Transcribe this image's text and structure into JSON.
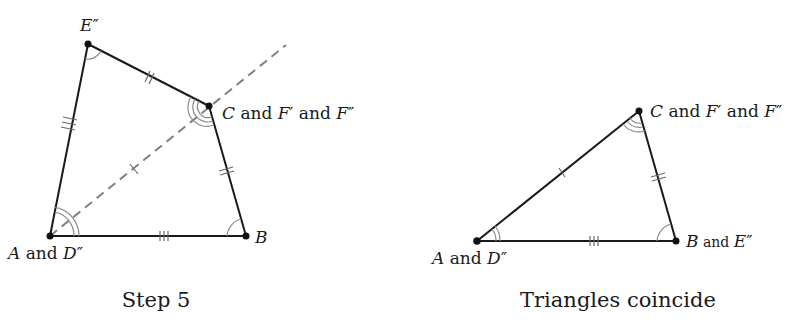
{
  "figures": [
    {
      "id": "step5",
      "caption": "Step 5",
      "vertices": {
        "E": {
          "x": 88,
          "y": 44,
          "label_main": "E",
          "label_rest": "″"
        },
        "C": {
          "x": 209,
          "y": 106,
          "label_main": "C",
          "label_rest": " and ",
          "label_f1": "F",
          "label_f1p": "′",
          "label_and2": " and ",
          "label_f2": "F",
          "label_f2p": "″"
        },
        "A": {
          "x": 50,
          "y": 236,
          "label_main": "A",
          "label_rest": " and ",
          "label_d": "D",
          "label_dp": "″"
        },
        "B": {
          "x": 246,
          "y": 236,
          "label_main": "B"
        }
      },
      "dashed_line": {
        "from": [
          50,
          236
        ],
        "to": [
          286,
          45
        ]
      },
      "tick_marks": {
        "A_E": 3,
        "E_C": 2,
        "C_B": 2,
        "A_B": 3,
        "A_C_dashed": 1
      },
      "angle_arcs": {
        "A": 2,
        "C": 3,
        "E": 1,
        "B": 1
      }
    },
    {
      "id": "coincide",
      "caption": "Triangles coincide",
      "vertices": {
        "C": {
          "x": 639,
          "y": 111,
          "label_main": "C",
          "label_rest": " and ",
          "label_f1": "F",
          "label_f1p": "′",
          "label_and2": " and ",
          "label_f2": "F",
          "label_f2p": "″"
        },
        "A": {
          "x": 477,
          "y": 241,
          "label_main": "A",
          "label_rest": " and ",
          "label_d": "D",
          "label_dp": "″"
        },
        "B": {
          "x": 676,
          "y": 241,
          "label_main": "B",
          "label_rest": " and ",
          "label_e": "E",
          "label_ep": "″"
        }
      },
      "tick_marks": {
        "A_C": 1,
        "C_B": 2,
        "A_B": 3
      },
      "angle_arcs": {
        "A": 2,
        "C": 3,
        "B": 1
      }
    }
  ]
}
